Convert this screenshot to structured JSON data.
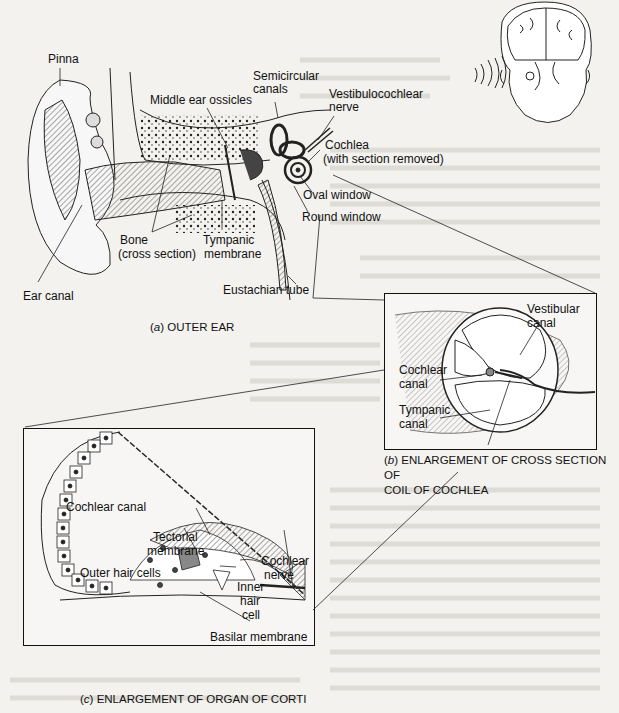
{
  "figure": {
    "panel_a": {
      "caption_letter": "a",
      "caption_text": "OUTER EAR",
      "labels": {
        "pinna": "Pinna",
        "middle_ear_ossicles": "Middle ear ossicles",
        "semicircular_canals_1": "Semicircular",
        "semicircular_canals_2": "canals",
        "vestibulocochlear_1": "Vestibulocochlear",
        "vestibulocochlear_2": "nerve",
        "cochlea_1": "Cochlea",
        "cochlea_2": "(with section removed)",
        "oval_window": "Oval window",
        "round_window": "Round window",
        "bone_1": "Bone",
        "bone_2": "(cross section)",
        "tympanic_1": "Tympanic",
        "tympanic_2": "membrane",
        "ear_canal": "Ear canal",
        "eustachian_tube": "Eustachian tube"
      }
    },
    "panel_b": {
      "caption_letter": "b",
      "caption_text_1": "ENLARGEMENT OF CROSS SECTION OF",
      "caption_text_2": "COIL OF COCHLEA",
      "labels": {
        "vestibular_1": "Vestibular",
        "vestibular_2": "canal",
        "cochlear_1": "Cochlear",
        "cochlear_2": "canal",
        "tympanic_1": "Tympanic",
        "tympanic_2": "canal"
      }
    },
    "panel_c": {
      "caption_letter": "c",
      "caption_text": "ENLARGEMENT OF ORGAN OF CORTI",
      "labels": {
        "cochlear_canal": "Cochlear canal",
        "tectorial_1": "Tectorial",
        "tectorial_2": "membrane",
        "outer_hair_cells": "Outer hair cells",
        "cochlear_nerve_1": "Cochlear",
        "cochlear_nerve_2": "nerve",
        "inner_1": "Inner",
        "inner_2": "hair",
        "inner_3": "cell",
        "basilar_membrane": "Basilar membrane"
      }
    }
  }
}
